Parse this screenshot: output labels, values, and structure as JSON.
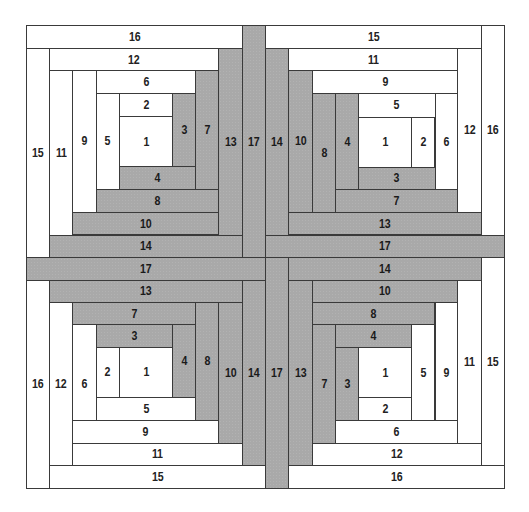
{
  "diagram": {
    "type": "log-cabin-quilt-layout",
    "colors": {
      "light": "#ffffff",
      "dark": "#a9a9a9",
      "outline": "#3a3a3a",
      "text": "#1a1a1a"
    },
    "blocks": [
      {
        "name": "top-left",
        "patches": [
          {
            "label": "16",
            "tone": "light",
            "x": 26,
            "y": 25,
            "w": 215.7,
            "h": 23
          },
          {
            "label": "15",
            "tone": "light",
            "x": 26,
            "y": 48,
            "w": 23,
            "h": 209
          },
          {
            "label": "12",
            "tone": "light",
            "x": 49,
            "y": 48,
            "w": 169.3,
            "h": 22
          },
          {
            "label": "11",
            "tone": "light",
            "x": 49,
            "y": 70,
            "w": 23,
            "h": 164.5
          },
          {
            "label": "9",
            "tone": "light",
            "x": 72,
            "y": 70,
            "w": 23.5,
            "h": 141.7
          },
          {
            "label": "6",
            "tone": "light",
            "x": 95.5,
            "y": 70,
            "w": 99.8,
            "h": 22.5
          },
          {
            "label": "5",
            "tone": "light",
            "x": 95.5,
            "y": 92.5,
            "w": 23.5,
            "h": 96.2
          },
          {
            "label": "2",
            "tone": "light",
            "x": 119,
            "y": 92.5,
            "w": 53,
            "h": 23.5
          },
          {
            "label": "1",
            "tone": "light",
            "x": 119,
            "y": 116,
            "w": 53,
            "h": 50
          },
          {
            "label": "3",
            "tone": "dark",
            "x": 172,
            "y": 92.5,
            "w": 23.3,
            "h": 73.5
          },
          {
            "label": "4",
            "tone": "dark",
            "x": 119,
            "y": 166,
            "w": 76.3,
            "h": 22.7
          },
          {
            "label": "7",
            "tone": "dark",
            "x": 195.3,
            "y": 70,
            "w": 23,
            "h": 118.7
          },
          {
            "label": "8",
            "tone": "dark",
            "x": 95.5,
            "y": 188.7,
            "w": 122.8,
            "h": 23
          },
          {
            "label": "13",
            "tone": "dark",
            "x": 218.3,
            "y": 48,
            "w": 23.4,
            "h": 186.5
          },
          {
            "label": "10",
            "tone": "dark",
            "x": 72,
            "y": 211.7,
            "w": 146.3,
            "h": 22.8
          },
          {
            "label": "14",
            "tone": "dark",
            "x": 49,
            "y": 234.5,
            "w": 192.7,
            "h": 22.5
          },
          {
            "label": "17",
            "tone": "dark",
            "x": 241.7,
            "y": 25,
            "w": 23.3,
            "h": 232
          }
        ]
      },
      {
        "name": "top-right",
        "patches": [
          {
            "label": "15",
            "tone": "light",
            "x": 265,
            "y": 25,
            "w": 216,
            "h": 23
          },
          {
            "label": "16",
            "tone": "light",
            "x": 481,
            "y": 25,
            "w": 23,
            "h": 209.5
          },
          {
            "label": "11",
            "tone": "light",
            "x": 288.3,
            "y": 48,
            "w": 168.7,
            "h": 22
          },
          {
            "label": "12",
            "tone": "light",
            "x": 457,
            "y": 48,
            "w": 24,
            "h": 163.7
          },
          {
            "label": "9",
            "tone": "light",
            "x": 311.7,
            "y": 70,
            "w": 145.3,
            "h": 23
          },
          {
            "label": "5",
            "tone": "light",
            "x": 358,
            "y": 93,
            "w": 76.5,
            "h": 23.5
          },
          {
            "label": "6",
            "tone": "light",
            "x": 434.5,
            "y": 93,
            "w": 22.5,
            "h": 96
          },
          {
            "label": "1",
            "tone": "light",
            "x": 358,
            "y": 116.5,
            "w": 52.7,
            "h": 50
          },
          {
            "label": "2",
            "tone": "light",
            "x": 410.7,
            "y": 116.5,
            "w": 23.8,
            "h": 50
          },
          {
            "label": "3",
            "tone": "dark",
            "x": 358,
            "y": 166.5,
            "w": 76.5,
            "h": 22.5
          },
          {
            "label": "4",
            "tone": "dark",
            "x": 335,
            "y": 93,
            "w": 23,
            "h": 96
          },
          {
            "label": "7",
            "tone": "dark",
            "x": 335,
            "y": 189,
            "w": 122,
            "h": 22.7
          },
          {
            "label": "8",
            "tone": "dark",
            "x": 311.7,
            "y": 93,
            "w": 23.3,
            "h": 118.7
          },
          {
            "label": "10",
            "tone": "dark",
            "x": 288.3,
            "y": 70,
            "w": 23.4,
            "h": 141.7
          },
          {
            "label": "13",
            "tone": "dark",
            "x": 288.3,
            "y": 211.7,
            "w": 192.7,
            "h": 22.8
          },
          {
            "label": "14",
            "tone": "dark",
            "x": 265,
            "y": 48,
            "w": 23.3,
            "h": 186.5
          },
          {
            "label": "17",
            "tone": "dark",
            "x": 265,
            "y": 234.5,
            "w": 239,
            "h": 22.5
          }
        ]
      },
      {
        "name": "bottom-left",
        "patches": [
          {
            "label": "17",
            "tone": "dark",
            "x": 26,
            "y": 257,
            "w": 239,
            "h": 22.5
          },
          {
            "label": "16",
            "tone": "light",
            "x": 26,
            "y": 279.5,
            "w": 23,
            "h": 208
          },
          {
            "label": "13",
            "tone": "dark",
            "x": 49,
            "y": 279.5,
            "w": 192.7,
            "h": 22.5
          },
          {
            "label": "12",
            "tone": "light",
            "x": 49,
            "y": 302,
            "w": 23,
            "h": 163
          },
          {
            "label": "7",
            "tone": "dark",
            "x": 72,
            "y": 302,
            "w": 123.3,
            "h": 22
          },
          {
            "label": "6",
            "tone": "light",
            "x": 72,
            "y": 324,
            "w": 23.5,
            "h": 118.5
          },
          {
            "label": "3",
            "tone": "dark",
            "x": 95.5,
            "y": 324,
            "w": 76.5,
            "h": 22.5
          },
          {
            "label": "2",
            "tone": "light",
            "x": 95.5,
            "y": 346.5,
            "w": 23.5,
            "h": 50.5
          },
          {
            "label": "1",
            "tone": "light",
            "x": 119,
            "y": 346.5,
            "w": 53,
            "h": 50.5
          },
          {
            "label": "4",
            "tone": "dark",
            "x": 172,
            "y": 324,
            "w": 23.3,
            "h": 73
          },
          {
            "label": "5",
            "tone": "light",
            "x": 95.5,
            "y": 397,
            "w": 99.8,
            "h": 22.5
          },
          {
            "label": "8",
            "tone": "dark",
            "x": 195.3,
            "y": 302,
            "w": 23,
            "h": 117.5
          },
          {
            "label": "9",
            "tone": "light",
            "x": 72,
            "y": 419.5,
            "w": 146.3,
            "h": 23
          },
          {
            "label": "10",
            "tone": "dark",
            "x": 218.3,
            "y": 302,
            "w": 23.4,
            "h": 140.5
          },
          {
            "label": "11",
            "tone": "light",
            "x": 72,
            "y": 442.5,
            "w": 169.7,
            "h": 22.5
          },
          {
            "label": "14",
            "tone": "dark",
            "x": 241.7,
            "y": 279.5,
            "w": 23.3,
            "h": 185.5
          },
          {
            "label": "15",
            "tone": "light",
            "x": 49,
            "y": 465,
            "w": 216,
            "h": 22.5
          }
        ]
      },
      {
        "name": "bottom-right",
        "patches": [
          {
            "label": "14",
            "tone": "dark",
            "x": 288.3,
            "y": 257,
            "w": 192.7,
            "h": 22.5
          },
          {
            "label": "15",
            "tone": "light",
            "x": 481,
            "y": 257,
            "w": 23,
            "h": 208
          },
          {
            "label": "17",
            "tone": "dark",
            "x": 265,
            "y": 257,
            "w": 23.3,
            "h": 230.5
          },
          {
            "label": "10",
            "tone": "dark",
            "x": 311.7,
            "y": 279.5,
            "w": 145.3,
            "h": 22.5
          },
          {
            "label": "11",
            "tone": "light",
            "x": 457,
            "y": 279.5,
            "w": 24,
            "h": 163
          },
          {
            "label": "13",
            "tone": "dark",
            "x": 288.3,
            "y": 279.5,
            "w": 23.4,
            "h": 185.5
          },
          {
            "label": "8",
            "tone": "dark",
            "x": 311.7,
            "y": 302,
            "w": 122.8,
            "h": 22
          },
          {
            "label": "9",
            "tone": "light",
            "x": 434.5,
            "y": 302,
            "w": 22.5,
            "h": 140.5
          },
          {
            "label": "7",
            "tone": "dark",
            "x": 311.7,
            "y": 324,
            "w": 23.3,
            "h": 118.5
          },
          {
            "label": "4",
            "tone": "dark",
            "x": 335,
            "y": 324,
            "w": 75.7,
            "h": 23
          },
          {
            "label": "5",
            "tone": "light",
            "x": 410.7,
            "y": 324,
            "w": 23.8,
            "h": 96
          },
          {
            "label": "3",
            "tone": "dark",
            "x": 335,
            "y": 347,
            "w": 23,
            "h": 73
          },
          {
            "label": "1",
            "tone": "light",
            "x": 358,
            "y": 347,
            "w": 52.7,
            "h": 50
          },
          {
            "label": "2",
            "tone": "light",
            "x": 358,
            "y": 397,
            "w": 52.7,
            "h": 23
          },
          {
            "label": "6",
            "tone": "light",
            "x": 335,
            "y": 420,
            "w": 122,
            "h": 22.5
          },
          {
            "label": "12",
            "tone": "light",
            "x": 311.7,
            "y": 442.5,
            "w": 169.3,
            "h": 22.5
          },
          {
            "label": "16",
            "tone": "light",
            "x": 288.3,
            "y": 465,
            "w": 215.7,
            "h": 22.5
          }
        ]
      }
    ]
  }
}
